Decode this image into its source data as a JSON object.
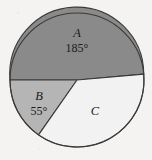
{
  "figure": {
    "background_color": "#f4f3f1",
    "outline_color": "#3a3a3a",
    "center_x": 77,
    "center_y": 80,
    "radius": 67
  },
  "chart_data": {
    "type": "pie",
    "title": "",
    "subtitle": "",
    "xlabel": "",
    "ylabel": "",
    "legend_position": "none",
    "grid": false,
    "units": "degrees",
    "total_degrees": 360,
    "start_angle_deg": 180,
    "direction": "clockwise",
    "categories": [
      "A",
      "B",
      "C"
    ],
    "values": [
      185,
      55,
      120
    ],
    "labels": [
      "A",
      "B",
      "C"
    ],
    "value_labels": [
      "185°",
      "55°",
      ""
    ],
    "colors": [
      "#8a8a8a",
      "#b5b5b5",
      "#f2f2f2"
    ],
    "slices": [
      {
        "name": "A",
        "label": "A",
        "value_label": "185°",
        "value": 185,
        "color": "#8a8a8a",
        "label_x": 77,
        "label_y": 34,
        "value_x": 77,
        "value_y": 49,
        "path": "M 77 80 L 10 80 A 67 67 0 1 1 143.74 74.16 Z"
      },
      {
        "name": "B",
        "label": "B",
        "value_label": "55°",
        "value": 55,
        "color": "#b5b5b5",
        "label_x": 39,
        "label_y": 97,
        "value_x": 39,
        "value_y": 112,
        "path": "M 77 80 L 38.58 134.88 A 67 67 0 0 1 10 80 Z"
      },
      {
        "name": "C",
        "label": "C",
        "value_label": "",
        "value": 120,
        "color": "#f2f2f2",
        "label_x": 95,
        "label_y": 112,
        "value_x": 95,
        "value_y": 126,
        "path": "M 77 80 L 143.74 74.16 A 67 67 0 0 1 38.58 134.88 Z"
      }
    ]
  }
}
